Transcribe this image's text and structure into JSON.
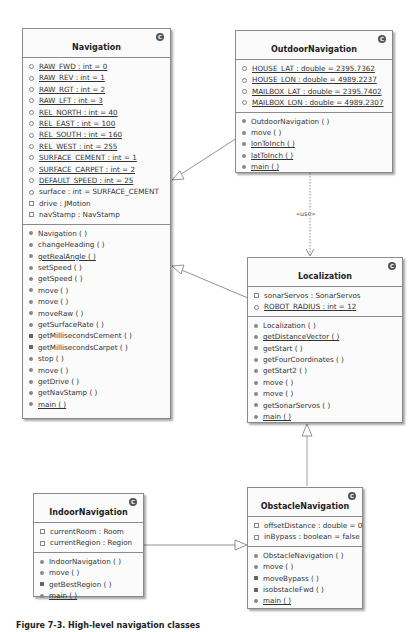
{
  "diagram": {
    "stereotype_label": "«use»",
    "caption": "Figure 7-3. High-level navigation classes",
    "classes": {
      "navigation": {
        "name": "Navigation",
        "badge": "C",
        "attributes": [
          {
            "text": "RAW_FWD : int = 0",
            "vis": "pkg",
            "static": true
          },
          {
            "text": "RAW_REV : int = 1",
            "vis": "pkg",
            "static": true
          },
          {
            "text": "RAW_RGT : int = 2",
            "vis": "pkg",
            "static": true
          },
          {
            "text": "RAW_LFT : int = 3",
            "vis": "pkg",
            "static": true
          },
          {
            "text": "REL_NORTH : int = 40",
            "vis": "pkg",
            "static": true
          },
          {
            "text": "REL_EAST : int = 100",
            "vis": "pkg",
            "static": true
          },
          {
            "text": "REL_SOUTH : int = 160",
            "vis": "pkg",
            "static": true
          },
          {
            "text": "REL_WEST : int = 255",
            "vis": "pkg",
            "static": true
          },
          {
            "text": "SURFACE_CEMENT : int = 1",
            "vis": "pkg",
            "static": true
          },
          {
            "text": "SURFACE_CARPET : int = 2",
            "vis": "pkg",
            "static": true
          },
          {
            "text": "DEFAULT_SPEED : int = 25",
            "vis": "pkg",
            "static": true
          },
          {
            "text": "surface : int = SURFACE_CEMENT",
            "vis": "pkg",
            "static": false
          },
          {
            "text": "drive : JMotion",
            "vis": "priv",
            "static": false
          },
          {
            "text": "navStamp : NavStamp",
            "vis": "priv",
            "static": false
          }
        ],
        "methods": [
          {
            "text": "Navigation ( )",
            "vis": "pub",
            "static": false
          },
          {
            "text": "changeHeading ( )",
            "vis": "pub",
            "static": false
          },
          {
            "text": "getRealAngle ( )",
            "vis": "pub",
            "static": true
          },
          {
            "text": "setSpeed ( )",
            "vis": "pub",
            "static": false
          },
          {
            "text": "getSpeed ( )",
            "vis": "pub",
            "static": false
          },
          {
            "text": "move ( )",
            "vis": "pub",
            "static": false
          },
          {
            "text": "move ( )",
            "vis": "pub",
            "static": false
          },
          {
            "text": "moveRaw ( )",
            "vis": "pub",
            "static": false
          },
          {
            "text": "getSurfaceRate ( )",
            "vis": "pub",
            "static": false
          },
          {
            "text": "getMillisecondsCement ( )",
            "vis": "prot",
            "static": false
          },
          {
            "text": "getMillisecondsCarpet ( )",
            "vis": "prot",
            "static": false
          },
          {
            "text": "stop ( )",
            "vis": "pub",
            "static": false
          },
          {
            "text": "move ( )",
            "vis": "pub",
            "static": false
          },
          {
            "text": "getDrive ( )",
            "vis": "pub",
            "static": false
          },
          {
            "text": "getNavStamp ( )",
            "vis": "pub",
            "static": false
          },
          {
            "text": "main ( )",
            "vis": "pub",
            "static": true
          }
        ]
      },
      "outdoor_navigation": {
        "name": "OutdoorNavigation",
        "badge": "C",
        "attributes": [
          {
            "text": "HOUSE_LAT : double = 2395.7362",
            "vis": "pkg",
            "static": true
          },
          {
            "text": "HOUSE_LON : double = 4989.2237",
            "vis": "pkg",
            "static": true
          },
          {
            "text": "MAILBOX_LAT : double = 2395.7402",
            "vis": "pkg",
            "static": true
          },
          {
            "text": "MAILBOX_LON : double = 4989.2307",
            "vis": "pkg",
            "static": true
          }
        ],
        "methods": [
          {
            "text": "OutdoorNavigation ( )",
            "vis": "pub",
            "static": false
          },
          {
            "text": "move ( )",
            "vis": "pub",
            "static": false
          },
          {
            "text": "lonToInch ( )",
            "vis": "pub",
            "static": true
          },
          {
            "text": "latToInch ( )",
            "vis": "pub",
            "static": true
          },
          {
            "text": "main ( )",
            "vis": "pub",
            "static": true
          }
        ]
      },
      "localization": {
        "name": "Localization",
        "badge": "C",
        "attributes": [
          {
            "text": "sonarServos : SonarServos",
            "vis": "priv",
            "static": false
          },
          {
            "text": "ROBOT_RADIUS : int = 12",
            "vis": "pkg",
            "static": true
          }
        ],
        "methods": [
          {
            "text": "Localization ( )",
            "vis": "pub",
            "static": false
          },
          {
            "text": "getDistanceVector ( )",
            "vis": "pub",
            "static": true
          },
          {
            "text": "getStart ( )",
            "vis": "pub",
            "static": false
          },
          {
            "text": "getFourCoordinates ( )",
            "vis": "pub",
            "static": false
          },
          {
            "text": "getStart2 ( )",
            "vis": "pub",
            "static": false
          },
          {
            "text": "move ( )",
            "vis": "pub",
            "static": false
          },
          {
            "text": "move ( )",
            "vis": "pub",
            "static": false
          },
          {
            "text": "getSonarServos ( )",
            "vis": "pub",
            "static": false
          },
          {
            "text": "main ( )",
            "vis": "pub",
            "static": true
          }
        ]
      },
      "indoor_navigation": {
        "name": "IndoorNavigation",
        "badge": "C",
        "attributes": [
          {
            "text": "currentRoom : Room",
            "vis": "priv",
            "static": false
          },
          {
            "text": "currentRegion : Region",
            "vis": "priv",
            "static": false
          }
        ],
        "methods": [
          {
            "text": "IndoorNavigation ( )",
            "vis": "pub",
            "static": false
          },
          {
            "text": "move ( )",
            "vis": "pub",
            "static": false
          },
          {
            "text": "getBestRegion ( )",
            "vis": "prot",
            "static": false
          },
          {
            "text": "main ( )",
            "vis": "pub",
            "static": true
          }
        ]
      },
      "obstacle_navigation": {
        "name": "ObstacleNavigation",
        "badge": "C",
        "attributes": [
          {
            "text": "offsetDistance : double = 0",
            "vis": "priv",
            "static": false
          },
          {
            "text": "inBypass : boolean = false",
            "vis": "priv",
            "static": false
          }
        ],
        "methods": [
          {
            "text": "ObstacleNavigation ( )",
            "vis": "pub",
            "static": false
          },
          {
            "text": "move ( )",
            "vis": "pub",
            "static": false
          },
          {
            "text": "moveBypass ( )",
            "vis": "prot",
            "static": false
          },
          {
            "text": "isobstacleFwd ( )",
            "vis": "prot",
            "static": false
          },
          {
            "text": "main ( )",
            "vis": "pub",
            "static": true
          }
        ]
      }
    }
  }
}
